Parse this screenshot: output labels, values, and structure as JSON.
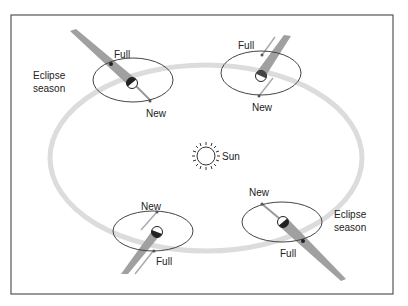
{
  "diagram": {
    "sun_label": "Sun",
    "positions": [
      {
        "id": "top-left",
        "full_label": "Full",
        "new_label": "New",
        "eclipse_season": true,
        "season_label_line1": "Eclipse",
        "season_label_line2": "season"
      },
      {
        "id": "top-right",
        "full_label": "Full",
        "new_label": "New",
        "eclipse_season": false
      },
      {
        "id": "bottom-left",
        "full_label": "Full",
        "new_label": "New",
        "eclipse_season": false
      },
      {
        "id": "bottom-right",
        "full_label": "Full",
        "new_label": "New",
        "eclipse_season": true,
        "season_label_line1": "Eclipse",
        "season_label_line2": "season"
      }
    ],
    "colors": {
      "frame": "#555555",
      "earth_orbit": "#d9d9d9",
      "shadow_cone": "#9a9a9a",
      "moon_orbit": "#444444",
      "text": "#222222"
    }
  }
}
